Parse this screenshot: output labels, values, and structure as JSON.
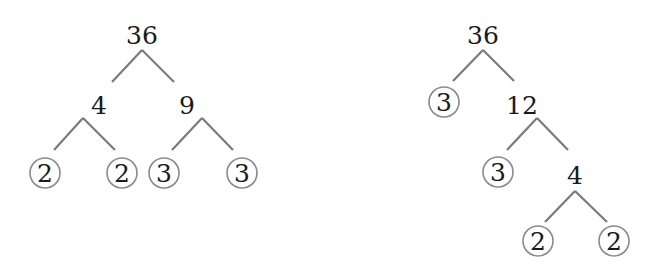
{
  "diagram": {
    "type": "factor-trees",
    "trees": [
      {
        "root": "36",
        "nodes": [
          {
            "id": "l-root",
            "label": "36",
            "x": 142,
            "y": 44,
            "prime": false
          },
          {
            "id": "l-4",
            "label": "4",
            "x": 99,
            "y": 114,
            "prime": false
          },
          {
            "id": "l-9",
            "label": "9",
            "x": 187,
            "y": 114,
            "prime": false
          },
          {
            "id": "l-2a",
            "label": "2",
            "x": 45,
            "y": 173,
            "prime": true
          },
          {
            "id": "l-2b",
            "label": "2",
            "x": 122,
            "y": 173,
            "prime": true
          },
          {
            "id": "l-3a",
            "label": "3",
            "x": 164,
            "y": 173,
            "prime": true
          },
          {
            "id": "l-3b",
            "label": "3",
            "x": 242,
            "y": 173,
            "prime": true
          }
        ],
        "prime_factors": [
          "2",
          "2",
          "3",
          "3"
        ]
      },
      {
        "root": "36",
        "nodes": [
          {
            "id": "r-root",
            "label": "36",
            "x": 483,
            "y": 44,
            "prime": false
          },
          {
            "id": "r-3a",
            "label": "3",
            "x": 444,
            "y": 102,
            "prime": true
          },
          {
            "id": "r-12",
            "label": "12",
            "x": 522,
            "y": 114,
            "prime": false
          },
          {
            "id": "r-3b",
            "label": "3",
            "x": 498,
            "y": 172,
            "prime": true
          },
          {
            "id": "r-4",
            "label": "4",
            "x": 575,
            "y": 184,
            "prime": false
          },
          {
            "id": "r-2a",
            "label": "2",
            "x": 538,
            "y": 240,
            "prime": true
          },
          {
            "id": "r-2b",
            "label": "2",
            "x": 614,
            "y": 240,
            "prime": true
          }
        ],
        "prime_factors": [
          "3",
          "3",
          "2",
          "2"
        ]
      }
    ],
    "colors": {
      "text": "#1a1a1a",
      "edge": "#7a7a7a",
      "circle": "#8a8a8a",
      "background": "#ffffff"
    }
  }
}
